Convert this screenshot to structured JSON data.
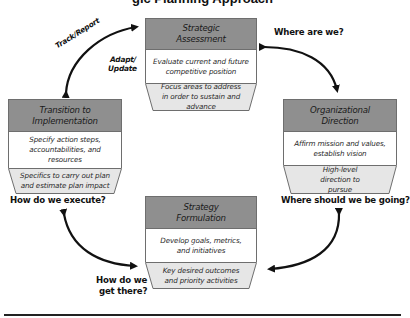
{
  "diagram": {
    "title_fragment": "gic Planning Approach",
    "colors": {
      "header_fill": "#8f8f8f",
      "trapezoid_fill": "#e6e6e6",
      "border": "#6e6e6e",
      "arrow": "#111111",
      "rule": "#222222"
    },
    "stages": [
      {
        "id": "strategic-assessment",
        "title": "Strategic Assessment",
        "activity": "Evaluate current and future competitive position",
        "output": "Focus areas to address in order to sustain and advance"
      },
      {
        "id": "organizational-direction",
        "title": "Organizational Direction",
        "activity": "Affirm mission and values, establish vision",
        "output": "High-level direction to pursue"
      },
      {
        "id": "strategy-formulation",
        "title": "Strategy Formulation",
        "activity": "Develop goals, metrics, and initiatives",
        "output": "Key desired outcomes and priority activities"
      },
      {
        "id": "transition-to-implementation",
        "title": "Transition to Implementation",
        "activity": "Specify action steps, accountabilities, and resources",
        "output": "Specifics to carry out plan and estimate plan impact"
      }
    ],
    "questions": {
      "where_are_we": "Where are we?",
      "where_going": "Where should we be going?",
      "how_get_there_1": "How do we",
      "how_get_there_2": "get there?",
      "how_execute": "How do we execute?"
    },
    "cycle_labels": {
      "track_report": "Track/Report",
      "adapt": "Adapt/",
      "update": "Update"
    }
  }
}
